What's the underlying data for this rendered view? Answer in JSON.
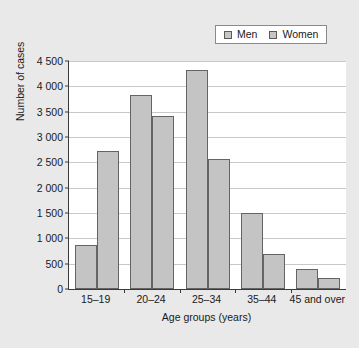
{
  "chart_data": {
    "type": "bar",
    "title": "",
    "subtitle": "",
    "xlabel": "Age groups (years)",
    "ylabel": "Number of cases",
    "categories": [
      "15–19",
      "20–24",
      "25–34",
      "35–44",
      "45 and over"
    ],
    "series": [
      {
        "name": "Men",
        "values": [
          870,
          3830,
          4320,
          1500,
          400
        ],
        "color": "#c4c4c4"
      },
      {
        "name": "Women",
        "values": [
          2720,
          3420,
          2560,
          700,
          210
        ],
        "color": "#c4c4c4"
      }
    ],
    "ylim": [
      0,
      4500
    ],
    "ytick_values": [
      0,
      500,
      1000,
      1500,
      2000,
      2500,
      3000,
      3500,
      4000,
      4500
    ],
    "ytick_labels": [
      "0",
      "500",
      "1 000",
      "1 500",
      "2 000",
      "2 500",
      "3 000",
      "3 500",
      "4 000",
      "4 500"
    ],
    "grid": "horizontal",
    "legend_position": "top-right"
  },
  "legend": {
    "entries": [
      {
        "label": "Men",
        "swatch": "legend-swatch-men"
      },
      {
        "label": "Women",
        "swatch": "legend-swatch-women"
      }
    ]
  },
  "axes": {
    "y_title": "Number of cases",
    "x_title": "Age groups (years)"
  },
  "colors": {
    "background": "#e9e9e9",
    "plot_background": "#ffffff",
    "bar_fill": "#c4c4c4",
    "bar_stroke": "#646464",
    "axis": "#3a3a3a",
    "gridline": "#c9c9c9",
    "text": "#1a1a1a"
  }
}
